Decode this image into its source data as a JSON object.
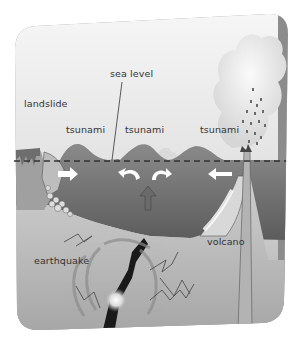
{
  "figure": {
    "type": "illustration",
    "palette": {
      "background": "#ffffff",
      "panel_top": "#f4f4f4",
      "panel_bottom": "#a9a9a9",
      "panel_edge": "#8f8f8f",
      "sea": "#7d7d7d",
      "sea_dark": "#5e5e5e",
      "seabed": "#c4c4c4",
      "plume": "#e6e6e6",
      "fault": "#1a1a1a",
      "text": "#333333"
    }
  },
  "labels": {
    "sea_level": "sea level",
    "landslide": "landslide",
    "tsunami_left": "tsunami",
    "tsunami_middle": "tsunami",
    "tsunami_right": "tsunami",
    "earthquake": "earthquake",
    "volcano": "volcano"
  }
}
